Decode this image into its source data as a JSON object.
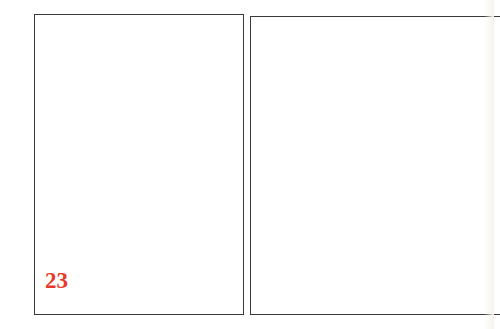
{
  "left_page": {
    "page_number": "23"
  },
  "right_page": {},
  "colors": {
    "page_number": "#e53a2c",
    "border": "#3a3a3a"
  }
}
